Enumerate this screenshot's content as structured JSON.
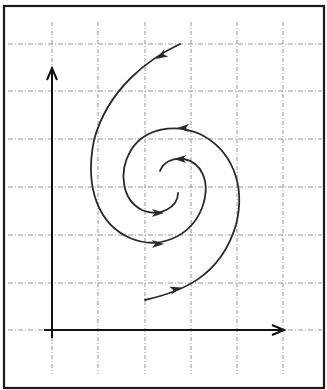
{
  "diagram": {
    "type": "phase-portrait-spiral",
    "colors": {
      "background": "#ffffff",
      "frame": "#1a1a1a",
      "grid": "#8a8a8a",
      "axes": "#111111",
      "curve": "#2a2a2a"
    },
    "frame": {
      "x": 4,
      "y": 6,
      "width": 320,
      "height": 382
    },
    "grid": {
      "vertical_x": [
        52,
        98,
        145,
        191,
        237,
        283
      ],
      "horizontal_y": [
        44,
        91,
        139,
        187,
        235,
        283,
        330
      ],
      "style": "dashed"
    },
    "axes": {
      "y_axis": {
        "x": 52,
        "y_start": 338,
        "y_end": 68,
        "arrow": "up",
        "label": ""
      },
      "x_axis": {
        "y": 330,
        "x_start": 44,
        "x_end": 284,
        "arrow": "right",
        "label": ""
      }
    },
    "trajectories": [
      {
        "name": "outer-trajectory-from-top",
        "path": "M180,44 C150,58 108,88 94,140 C84,190 100,225 130,238 C158,250 190,238 202,208 C212,180 200,162 184,159 C172,157 163,163 160,171",
        "arrows": [
          {
            "x": 161,
            "y": 56,
            "angle": 150
          },
          {
            "x": 158,
            "y": 244,
            "angle": 0
          },
          {
            "x": 180,
            "y": 159,
            "angle": 180
          }
        ]
      },
      {
        "name": "inner-trajectory-from-bottom",
        "path": "M145,300 C180,292 220,278 236,225 C246,185 232,150 200,134 C175,123 145,128 131,150 C118,172 122,200 142,210 C160,218 178,207 178,193",
        "arrows": [
          {
            "x": 176,
            "y": 289,
            "angle": -15
          },
          {
            "x": 183,
            "y": 128,
            "angle": 180
          },
          {
            "x": 158,
            "y": 213,
            "angle": 0
          }
        ]
      }
    ]
  }
}
